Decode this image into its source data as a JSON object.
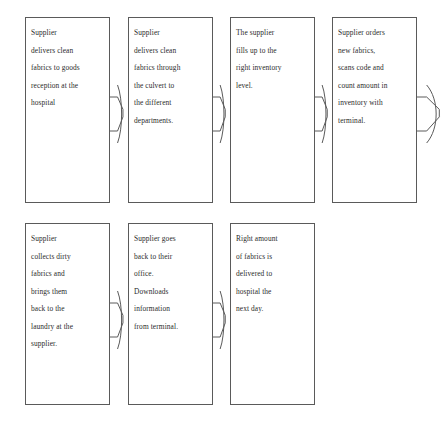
{
  "diagram": {
    "type": "flowchart",
    "style": {
      "box_border_color": "#5a5a5a",
      "text_color": "#2b2b2b",
      "background_color": "#ffffff",
      "connector_color": "#5a5a5a"
    },
    "rows": [
      {
        "row_name": "clean-fabrics-delivery-row",
        "boxes": [
          {
            "name": "box-supplier-delivers-clean-fabrics-reception",
            "lines": [
              "Supplier",
              "delivers clean",
              "fabrics to goods",
              "reception at the",
              "hospital"
            ]
          },
          {
            "name": "box-supplier-delivers-through-culvert",
            "lines": [
              "Supplier",
              "delivers clean",
              "fabrics through",
              "the culvert to",
              "the different",
              "departments."
            ]
          },
          {
            "name": "box-supplier-fills-inventory-level",
            "lines": [
              "The supplier",
              "fills up to the",
              "right inventory",
              "level."
            ]
          },
          {
            "name": "box-supplier-orders-scans-counts",
            "lines": [
              "Supplier orders",
              "new fabrics,",
              "scans code and",
              "count amount in",
              "inventory with",
              "terminal."
            ]
          }
        ]
      },
      {
        "row_name": "dirty-fabrics-return-row",
        "boxes": [
          {
            "name": "box-supplier-collects-dirty-fabrics",
            "lines": [
              "Supplier",
              "collects dirty",
              "fabrics and",
              "brings them",
              "back to the",
              "laundry at the",
              "supplier."
            ]
          },
          {
            "name": "box-supplier-downloads-information",
            "lines": [
              "Supplier goes",
              "back to their",
              "office.",
              "Downloads",
              "information",
              "from terminal."
            ]
          },
          {
            "name": "box-right-amount-delivered-next-day",
            "lines": [
              "Right amount",
              "of fabrics is",
              "delivered to",
              "hospital the",
              "next day."
            ]
          }
        ]
      }
    ],
    "connectors": [
      {
        "name": "connector-row1-box1-to-box2",
        "variant": "zigzag"
      },
      {
        "name": "connector-row1-box2-to-box3",
        "variant": "zigzag"
      },
      {
        "name": "connector-row1-box3-to-box4",
        "variant": "zigzag"
      },
      {
        "name": "connector-row1-box4-to-right-edge",
        "variant": "wide-bracket"
      },
      {
        "name": "connector-row2-box1-to-box2",
        "variant": "zigzag"
      },
      {
        "name": "connector-row2-box2-to-box3",
        "variant": "zigzag"
      }
    ]
  }
}
